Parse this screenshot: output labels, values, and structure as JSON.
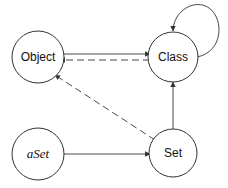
{
  "nodes": [
    {
      "id": "object",
      "label": "Object",
      "italic": false
    },
    {
      "id": "class",
      "label": "Class",
      "italic": false
    },
    {
      "id": "aset",
      "label": "aSet",
      "italic": true
    },
    {
      "id": "set",
      "label": "Set",
      "italic": false
    }
  ],
  "edges": [
    {
      "from": "Object",
      "to": "Class",
      "style": "solid"
    },
    {
      "from": "Class",
      "to": "Object",
      "style": "dashed"
    },
    {
      "from": "Class",
      "to": "Class",
      "style": "solid",
      "note": "self-loop"
    },
    {
      "from": "Set",
      "to": "Class",
      "style": "solid"
    },
    {
      "from": "Set",
      "to": "Object",
      "style": "dashed"
    },
    {
      "from": "aSet",
      "to": "Set",
      "style": "solid"
    }
  ]
}
